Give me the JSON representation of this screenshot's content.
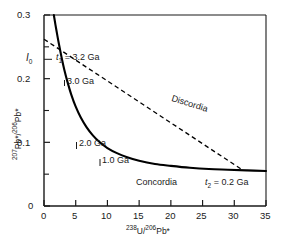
{
  "chart_data": {
    "type": "line",
    "title": "",
    "xlabel": "238U/206Pb*",
    "ylabel": "207Pb*/206Pb*",
    "xlim": [
      0,
      35
    ],
    "ylim": [
      0,
      0.3
    ],
    "xticks": [
      "0",
      "5",
      "10",
      "15",
      "20",
      "25",
      "30",
      "35"
    ],
    "xtick_values": [
      0,
      5,
      10,
      15,
      20,
      25,
      30,
      35
    ],
    "yticks": [
      "0",
      "0.1",
      "0.2",
      "0.3"
    ],
    "ytick_values": [
      0,
      0.1,
      0.2,
      0.3
    ],
    "ytick_minor_values": [
      0.05,
      0.15,
      0.25
    ],
    "grid": false,
    "legend": "none",
    "series": [
      {
        "name": "Concordia",
        "style": "solid",
        "color": "#000000",
        "points": [
          [
            1.55,
            0.3
          ],
          [
            1.8,
            0.285
          ],
          [
            2.1,
            0.268
          ],
          [
            2.4,
            0.252
          ],
          [
            2.8,
            0.232
          ],
          [
            3.2,
            0.214
          ],
          [
            3.7,
            0.195
          ],
          [
            4.3,
            0.175
          ],
          [
            5.0,
            0.156
          ],
          [
            5.8,
            0.139
          ],
          [
            6.7,
            0.124
          ],
          [
            7.7,
            0.111
          ],
          [
            8.8,
            0.1
          ],
          [
            10.0,
            0.091
          ],
          [
            11.5,
            0.083
          ],
          [
            13.0,
            0.077
          ],
          [
            15.0,
            0.071
          ],
          [
            17.5,
            0.066
          ],
          [
            20.0,
            0.063
          ],
          [
            23.0,
            0.06
          ],
          [
            26.0,
            0.058
          ],
          [
            29.0,
            0.057
          ],
          [
            32.0,
            0.056
          ],
          [
            35.0,
            0.055
          ]
        ]
      },
      {
        "name": "Discordia",
        "style": "dashed",
        "color": "#000000",
        "points": [
          [
            0.0,
            0.262
          ],
          [
            31.3,
            0.0565
          ]
        ]
      }
    ],
    "annotations": [
      {
        "id": "i0",
        "text": "I0",
        "x": 0.0,
        "y": 0.262
      },
      {
        "id": "t1",
        "text": "t1 = 3.2 Ga",
        "x": 3.4,
        "y": 0.268
      },
      {
        "id": "age-3-0",
        "text": "3.0 Ga",
        "x": 3.1,
        "y": 0.214
      },
      {
        "id": "age-2-0",
        "text": "2.0 Ga",
        "x": 5.1,
        "y": 0.117
      },
      {
        "id": "age-1-0",
        "text": "1.0 Ga",
        "x": 9.0,
        "y": 0.089
      },
      {
        "id": "concordia",
        "text": "Concordia",
        "x": 16.8,
        "y": 0.04
      },
      {
        "id": "discordia",
        "text": "Discordia",
        "x": 22.0,
        "y": 0.122
      },
      {
        "id": "t2",
        "text": "t2 = 0.2 Ga",
        "x": 28.0,
        "y": 0.04
      }
    ]
  },
  "labels": {
    "y_axis_title_pre": "207",
    "y_axis_title_mid": "Pb*/",
    "y_axis_title_sup2": "206",
    "y_axis_title_post": "Pb*",
    "x_axis_title_pre": "238",
    "x_axis_title_mid": "U/",
    "x_axis_title_sup2": "206",
    "x_axis_title_post": "Pb*",
    "ytick_0": "0",
    "ytick_1": "0.1",
    "ytick_2": "0.2",
    "ytick_3": "0.3",
    "xtick_0": "0",
    "xtick_1": "5",
    "xtick_2": "10",
    "xtick_3": "15",
    "xtick_4": "20",
    "xtick_5": "25",
    "xtick_6": "30",
    "xtick_7": "35",
    "i0_main": "I",
    "i0_sub": "0",
    "t1_var": "t",
    "t1_sub": "1",
    "t1_rest": " = 3.2 Ga",
    "age_3_0": "3.0 Ga",
    "age_2_0": "2.0 Ga",
    "age_1_0": "1.0 Ga",
    "concordia": "Concordia",
    "discordia": "Discordia",
    "t2_var": "t",
    "t2_sub": "2",
    "t2_rest": " = 0.2 Ga"
  }
}
